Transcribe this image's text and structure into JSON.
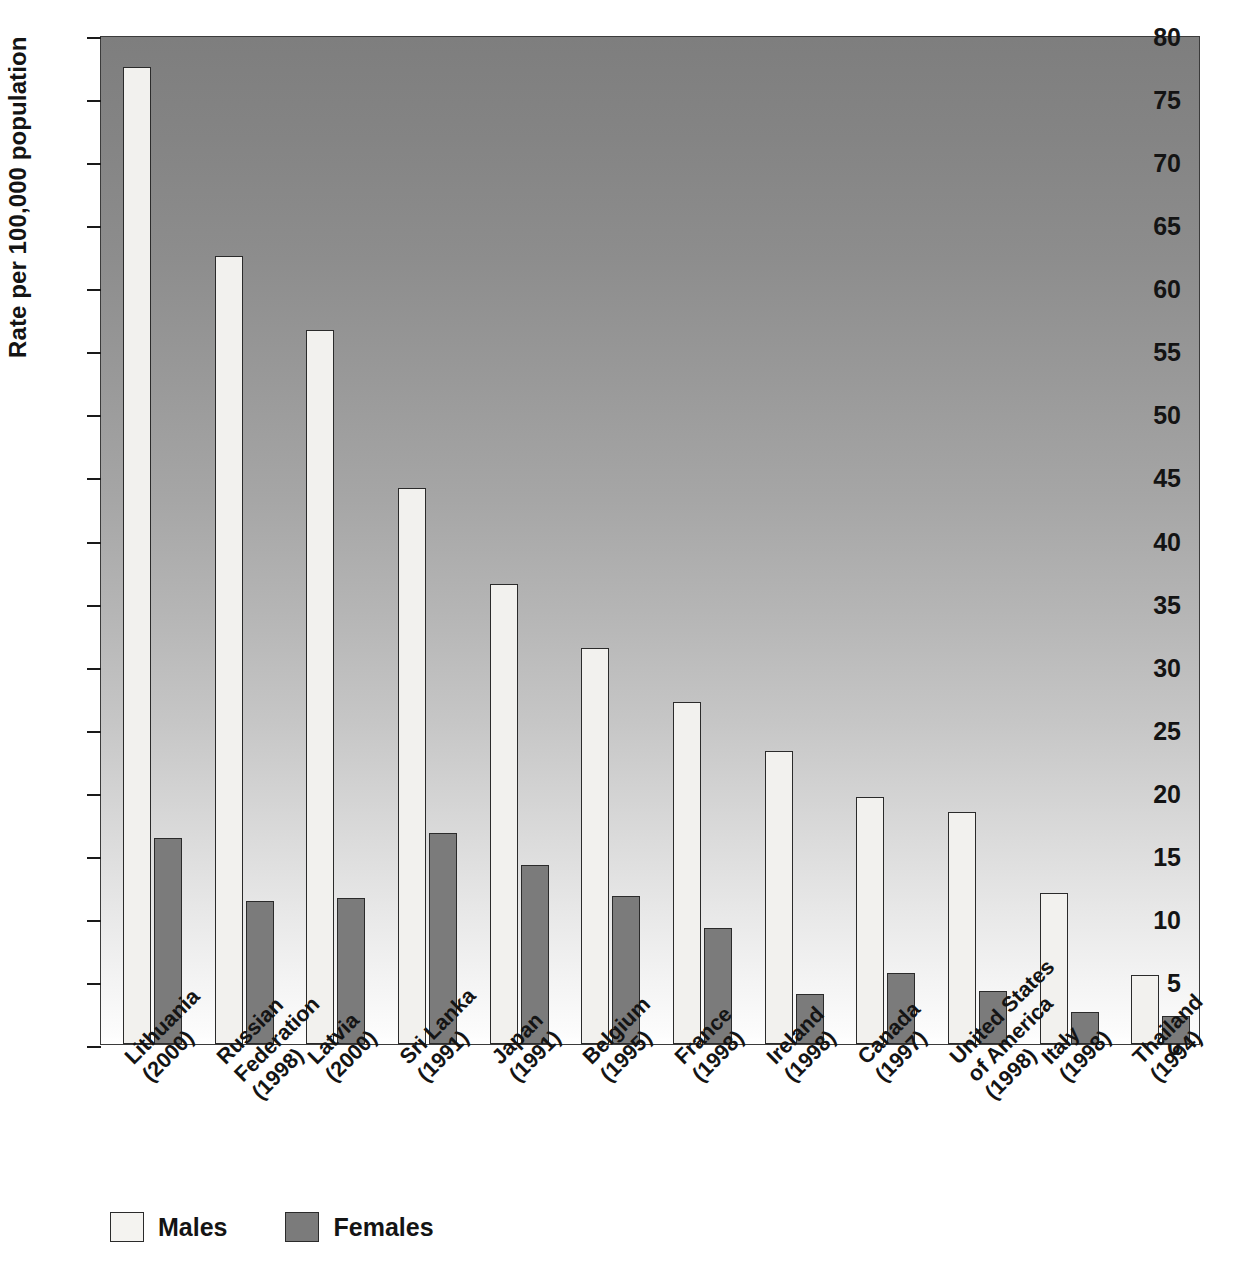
{
  "chart_data": {
    "type": "bar",
    "title": "",
    "xlabel": "",
    "ylabel": "Rate per 100,000 population",
    "ylim": [
      0,
      80
    ],
    "yticks": [
      0,
      5,
      10,
      15,
      20,
      25,
      30,
      35,
      40,
      45,
      50,
      55,
      60,
      65,
      70,
      75,
      80
    ],
    "grid": false,
    "legend_position": "bottom-left",
    "categories": [
      "Lithuania\n(2000)",
      "Russian\nFederation\n(1998)",
      "Latvia\n(2000)",
      "Sri Lanka\n(1991)",
      "Japan\n(1991)",
      "Belgium\n(1995)",
      "France\n(1998)",
      "Ireland\n(1998)",
      "Canada\n(1997)",
      "United States\nof America\n(1998)",
      "Italy\n(1998)",
      "Thailand\n(1994)"
    ],
    "series": [
      {
        "name": "Males",
        "color": "#f2f1ee",
        "values": [
          77.5,
          62.5,
          56.6,
          44.1,
          36.5,
          31.4,
          27.1,
          23.2,
          19.6,
          18.4,
          12.0,
          5.5
        ]
      },
      {
        "name": "Females",
        "color": "#7b7b7b",
        "values": [
          16.3,
          11.3,
          11.6,
          16.7,
          14.2,
          11.7,
          9.2,
          4.0,
          5.6,
          4.2,
          2.5,
          2.2
        ]
      }
    ]
  },
  "legend": {
    "items": [
      {
        "label": "Males",
        "swatch": "male-swatch"
      },
      {
        "label": "Females",
        "swatch": "female-swatch"
      }
    ]
  },
  "colors": {
    "male_bar": "#f2f1ee",
    "female_bar": "#7b7b7b",
    "bar_outline": "#2b2b2b",
    "plot_bg_top": "#7e7e7e",
    "plot_bg_bottom": "#ffffff",
    "text": "#141414"
  }
}
